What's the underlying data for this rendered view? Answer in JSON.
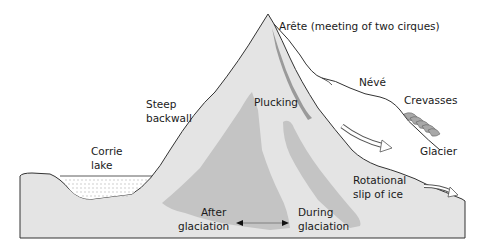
{
  "colors": {
    "rock_light": "#e4e4e4",
    "rock_dark": "#c4c4c4",
    "ice_edge": "#8a8a8a",
    "outline": "#333333",
    "background": "#ffffff",
    "crevasse": "#a8a8a8"
  },
  "labels": {
    "arete": "Arête (meeting of two cirques)",
    "neve": "Névé",
    "crevasses": "Crevasses",
    "glacier": "Glacier",
    "plucking": "Plucking",
    "steep_line1": "Steep",
    "steep_line2": "backwall",
    "corrie_line1": "Corrie",
    "corrie_line2": "lake",
    "rotational_line1": "Rotational",
    "rotational_line2": "slip of ice",
    "after_line1": "After",
    "after_line2": "glaciation",
    "during_line1": "During",
    "during_line2": "glaciation"
  },
  "icons": {
    "flow_arrow_1": "ice-flow-arrow",
    "flow_arrow_2": "glacier-flow-arrow",
    "double_arrow": "double-headed-arrow"
  }
}
